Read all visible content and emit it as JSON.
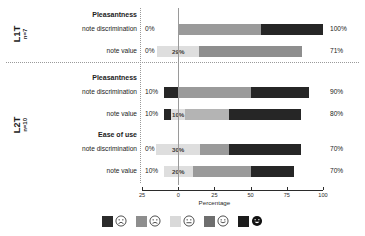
{
  "chart_data": {
    "type": "bar",
    "subtype": "diverging-stacked-likert",
    "title": "",
    "xlabel": "Percentage",
    "ylabel": "",
    "xlim": [
      -25,
      100
    ],
    "xticks": [
      -25,
      0,
      25,
      50,
      75,
      100
    ],
    "xtick_labels": [
      "25",
      "0",
      "25",
      "50",
      "75",
      "100"
    ],
    "grid": false,
    "legend_position": "bottom",
    "legend": [
      {
        "label": "very unpleasant",
        "icon": "face-very-sad-icon",
        "color": "#2b2b2b"
      },
      {
        "label": "unpleasant",
        "icon": "face-sad-icon",
        "color": "#8e8e8e"
      },
      {
        "label": "neutral",
        "icon": "face-neutral-icon",
        "color": "#d9d9d9"
      },
      {
        "label": "pleasant",
        "icon": "face-happy-icon",
        "color": "#6e6e6e"
      },
      {
        "label": "very pleasant",
        "icon": "face-very-happy-icon",
        "color": "#1c1c1c"
      }
    ],
    "groups": [
      {
        "name": "L1T",
        "n_label": "n=7",
        "sections": [
          {
            "heading": "Pleasantness",
            "rows": [
              {
                "label": "note discrimination",
                "left_pct": "0%",
                "right_pct": "100%",
                "negative_total": 0,
                "neutral": 0,
                "neutral_label": "",
                "segments": [
                  {
                    "key": "neutral-pleasant",
                    "value": 57,
                    "color": "#9a9a9a"
                  },
                  {
                    "key": "very-pleasant",
                    "value": 43,
                    "color": "#262626"
                  }
                ]
              },
              {
                "label": "note value",
                "left_pct": "0%",
                "right_pct": "71%",
                "negative_total": 0,
                "neutral": 29,
                "neutral_label": "29%",
                "segments": [
                  {
                    "key": "pleasant",
                    "value": 71,
                    "color": "#8e8e8e"
                  }
                ]
              }
            ]
          }
        ]
      },
      {
        "name": "L2T",
        "n_label": "n=10",
        "sections": [
          {
            "heading": "Pleasantness",
            "rows": [
              {
                "label": "note discrimination",
                "left_pct": "10%",
                "right_pct": "90%",
                "negative_total": 10,
                "neutral": 0,
                "neutral_label": "",
                "segments": [
                  {
                    "key": "pleasant",
                    "value": 50,
                    "color": "#9a9a9a"
                  },
                  {
                    "key": "very-pleasant",
                    "value": 40,
                    "color": "#262626"
                  }
                ]
              },
              {
                "label": "note value",
                "left_pct": "10%",
                "right_pct": "80%",
                "negative_total": 10,
                "neutral": 10,
                "neutral_label": "10%",
                "segments": [
                  {
                    "key": "pleasant",
                    "value": 30,
                    "color": "#b4b4b4"
                  },
                  {
                    "key": "very-pleasant",
                    "value": 50,
                    "color": "#262626"
                  }
                ]
              }
            ]
          },
          {
            "heading": "Ease of use",
            "rows": [
              {
                "label": "note discrimination",
                "left_pct": "0%",
                "right_pct": "70%",
                "negative_total": 0,
                "neutral": 30,
                "neutral_label": "30%",
                "segments": [
                  {
                    "key": "pleasant",
                    "value": 20,
                    "color": "#9a9a9a"
                  },
                  {
                    "key": "very-pleasant",
                    "value": 50,
                    "color": "#262626"
                  }
                ]
              },
              {
                "label": "note value",
                "left_pct": "10%",
                "right_pct": "70%",
                "negative_total": 10,
                "neutral": 20,
                "neutral_label": "20%",
                "segments": [
                  {
                    "key": "pleasant",
                    "value": 40,
                    "color": "#9a9a9a"
                  },
                  {
                    "key": "very-pleasant",
                    "value": 30,
                    "color": "#262626"
                  }
                ]
              }
            ]
          }
        ]
      }
    ]
  }
}
